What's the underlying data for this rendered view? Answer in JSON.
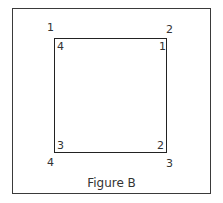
{
  "figure": {
    "caption": "Figure B",
    "outer_labels": {
      "top_left": "1",
      "top_right": "2",
      "bottom_right": "3",
      "bottom_left": "4"
    },
    "inner_labels": {
      "top_left": "4",
      "top_right": "1",
      "bottom_right": "2",
      "bottom_left": "3"
    }
  }
}
